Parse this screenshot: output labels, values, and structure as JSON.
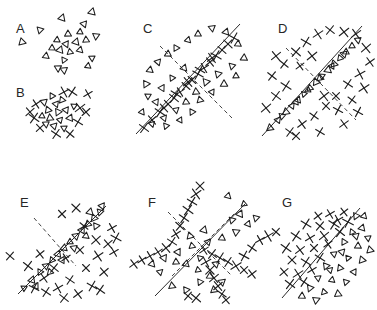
{
  "figure": {
    "width": 377,
    "height": 310,
    "background_color": "#ffffff",
    "ink_color": "#1f1f1f",
    "marker_types": {
      "triangle": "open-triangle-marker",
      "cross": "x-cross-marker"
    }
  },
  "panels": [
    {
      "id": "A",
      "label": "A",
      "label_x": 16,
      "label_y": 22,
      "origin_x": 0,
      "origin_y": 0,
      "description": "Loose isotropic cluster of open triangles only",
      "has_solid_line": false,
      "has_dashed_line": false,
      "triangles": [
        [
          62,
          18
        ],
        [
          92,
          12
        ],
        [
          40,
          30
        ],
        [
          68,
          34
        ],
        [
          80,
          32
        ],
        [
          57,
          40
        ],
        [
          66,
          44
        ],
        [
          76,
          42
        ],
        [
          86,
          40
        ],
        [
          22,
          42
        ],
        [
          60,
          50
        ],
        [
          70,
          52
        ],
        [
          80,
          50
        ],
        [
          52,
          48
        ],
        [
          64,
          60
        ],
        [
          96,
          36
        ],
        [
          92,
          58
        ],
        [
          58,
          68
        ],
        [
          64,
          70
        ],
        [
          88,
          66
        ],
        [
          46,
          56
        ],
        [
          84,
          24
        ]
      ],
      "crosses": []
    },
    {
      "id": "B",
      "label": "B",
      "label_x": 16,
      "label_y": 86,
      "origin_x": 0,
      "origin_y": 0,
      "description": "Mixed cluster of triangles and crosses, no structure",
      "has_solid_line": false,
      "has_dashed_line": false,
      "triangles": [
        [
          52,
          96
        ],
        [
          44,
          102
        ],
        [
          56,
          104
        ],
        [
          48,
          110
        ],
        [
          62,
          100
        ],
        [
          58,
          112
        ],
        [
          66,
          110
        ],
        [
          50,
          118
        ],
        [
          60,
          120
        ],
        [
          70,
          118
        ],
        [
          42,
          116
        ],
        [
          54,
          126
        ],
        [
          64,
          128
        ],
        [
          74,
          106
        ],
        [
          46,
          124
        ]
      ],
      "crosses": [
        [
          72,
          92
        ],
        [
          88,
          94
        ],
        [
          36,
          104
        ],
        [
          80,
          108
        ],
        [
          86,
          112
        ],
        [
          34,
          118
        ],
        [
          40,
          128
        ],
        [
          56,
          134
        ],
        [
          70,
          134
        ],
        [
          78,
          122
        ],
        [
          30,
          112
        ],
        [
          64,
          92
        ]
      ]
    },
    {
      "id": "C",
      "label": "C",
      "label_x": 143,
      "label_y": 22,
      "origin_x": 0,
      "origin_y": 0,
      "description": "Dense chain of crosses along a solid diagonal; triangles spread around; dashed perpendicular axis",
      "has_solid_line": true,
      "has_dashed_line": true,
      "solid_line": [
        136,
        134,
        240,
        24
      ],
      "dashed_line": [
        160,
        46,
        232,
        118
      ],
      "crosses": [
        [
          144,
          128
        ],
        [
          152,
          120
        ],
        [
          160,
          112
        ],
        [
          168,
          104
        ],
        [
          174,
          98
        ],
        [
          180,
          92
        ],
        [
          186,
          86
        ],
        [
          192,
          80
        ],
        [
          198,
          74
        ],
        [
          204,
          68
        ],
        [
          210,
          62
        ],
        [
          216,
          56
        ],
        [
          222,
          50
        ],
        [
          228,
          44
        ],
        [
          234,
          38
        ],
        [
          164,
          108
        ],
        [
          176,
          94
        ],
        [
          188,
          82
        ],
        [
          200,
          70
        ],
        [
          212,
          58
        ]
      ],
      "triangles": [
        [
          158,
          62
        ],
        [
          168,
          54
        ],
        [
          150,
          70
        ],
        [
          176,
          48
        ],
        [
          188,
          40
        ],
        [
          198,
          34
        ],
        [
          212,
          28
        ],
        [
          226,
          32
        ],
        [
          238,
          44
        ],
        [
          244,
          58
        ],
        [
          232,
          66
        ],
        [
          218,
          74
        ],
        [
          206,
          82
        ],
        [
          196,
          92
        ],
        [
          186,
          102
        ],
        [
          176,
          110
        ],
        [
          164,
          118
        ],
        [
          152,
          124
        ],
        [
          142,
          112
        ],
        [
          148,
          96
        ],
        [
          162,
          88
        ],
        [
          172,
          78
        ],
        [
          184,
          68
        ],
        [
          200,
          100
        ],
        [
          212,
          92
        ],
        [
          224,
          84
        ],
        [
          236,
          76
        ],
        [
          146,
          84
        ],
        [
          156,
          102
        ],
        [
          166,
          126
        ],
        [
          180,
          120
        ],
        [
          192,
          112
        ]
      ]
    },
    {
      "id": "D",
      "label": "D",
      "label_x": 278,
      "label_y": 22,
      "origin_x": 0,
      "origin_y": 0,
      "description": "Dense chain of triangles along a solid diagonal; crosses spread around; dashed perpendicular axis",
      "has_solid_line": true,
      "has_dashed_line": true,
      "solid_line": [
        262,
        136,
        362,
        26
      ],
      "dashed_line": [
        286,
        48,
        356,
        120
      ],
      "triangles": [
        [
          270,
          128
        ],
        [
          278,
          120
        ],
        [
          286,
          112
        ],
        [
          292,
          106
        ],
        [
          298,
          100
        ],
        [
          304,
          94
        ],
        [
          310,
          88
        ],
        [
          316,
          82
        ],
        [
          322,
          76
        ],
        [
          328,
          70
        ],
        [
          334,
          64
        ],
        [
          340,
          58
        ],
        [
          346,
          52
        ],
        [
          352,
          46
        ],
        [
          358,
          40
        ],
        [
          282,
          116
        ],
        [
          296,
          102
        ],
        [
          308,
          90
        ],
        [
          320,
          78
        ],
        [
          332,
          66
        ],
        [
          344,
          54
        ]
      ],
      "crosses": [
        [
          284,
          64
        ],
        [
          296,
          52
        ],
        [
          272,
          76
        ],
        [
          306,
          42
        ],
        [
          318,
          34
        ],
        [
          330,
          30
        ],
        [
          344,
          32
        ],
        [
          356,
          34
        ],
        [
          366,
          48
        ],
        [
          370,
          62
        ],
        [
          360,
          74
        ],
        [
          348,
          84
        ],
        [
          336,
          96
        ],
        [
          326,
          106
        ],
        [
          314,
          116
        ],
        [
          302,
          124
        ],
        [
          290,
          132
        ],
        [
          276,
          96
        ],
        [
          266,
          108
        ],
        [
          300,
          66
        ],
        [
          312,
          56
        ],
        [
          324,
          96
        ],
        [
          338,
          110
        ],
        [
          352,
          100
        ],
        [
          364,
          88
        ],
        [
          286,
          86
        ],
        [
          276,
          56
        ],
        [
          296,
          136
        ],
        [
          320,
          132
        ],
        [
          344,
          124
        ],
        [
          358,
          112
        ]
      ]
    },
    {
      "id": "E",
      "label": "E",
      "label_x": 20,
      "label_y": 196,
      "origin_x": 0,
      "origin_y": 0,
      "description": "Triangles along a solid diagonal; crosses concentrated to the lower-right half; short dashed axis",
      "has_solid_line": true,
      "has_dashed_line": true,
      "solid_line": [
        18,
        294,
        106,
        206
      ],
      "dashed_line": [
        34,
        218,
        76,
        266
      ],
      "triangles": [
        [
          24,
          288
        ],
        [
          32,
          280
        ],
        [
          40,
          272
        ],
        [
          46,
          266
        ],
        [
          52,
          260
        ],
        [
          58,
          254
        ],
        [
          64,
          248
        ],
        [
          70,
          242
        ],
        [
          76,
          236
        ],
        [
          82,
          230
        ],
        [
          88,
          224
        ],
        [
          94,
          218
        ],
        [
          100,
          212
        ],
        [
          36,
          286
        ],
        [
          50,
          272
        ],
        [
          62,
          260
        ],
        [
          74,
          248
        ],
        [
          86,
          236
        ],
        [
          96,
          226
        ],
        [
          90,
          212
        ],
        [
          102,
          206
        ]
      ],
      "crosses": [
        [
          62,
          214
        ],
        [
          76,
          208
        ],
        [
          10,
          256
        ],
        [
          84,
          226
        ],
        [
          96,
          240
        ],
        [
          80,
          250
        ],
        [
          66,
          258
        ],
        [
          54,
          268
        ],
        [
          44,
          278
        ],
        [
          34,
          288
        ],
        [
          46,
          292
        ],
        [
          58,
          288
        ],
        [
          70,
          280
        ],
        [
          86,
          268
        ],
        [
          98,
          256
        ],
        [
          108,
          244
        ],
        [
          112,
          228
        ],
        [
          104,
          272
        ],
        [
          92,
          286
        ],
        [
          78,
          294
        ],
        [
          64,
          298
        ],
        [
          40,
          254
        ],
        [
          28,
          266
        ],
        [
          114,
          252
        ],
        [
          100,
          290
        ],
        [
          116,
          238
        ]
      ]
    },
    {
      "id": "F",
      "label": "F",
      "label_x": 148,
      "label_y": 196,
      "origin_x": 0,
      "origin_y": 0,
      "description": "Crosses arranged along two crossing dashed diagonals forming an X; triangles fill the remaining quadrants; one solid separating line",
      "has_solid_line": true,
      "has_dashed_line": true,
      "solid_line": [
        155,
        296,
        245,
        204
      ],
      "dashed_line": [
        168,
        212,
        232,
        276
      ],
      "dashed_line_2": [
        172,
        276,
        236,
        212
      ],
      "crosses": [
        [
          200,
          186
        ],
        [
          196,
          194
        ],
        [
          192,
          202
        ],
        [
          188,
          210
        ],
        [
          184,
          218
        ],
        [
          180,
          226
        ],
        [
          176,
          234
        ],
        [
          172,
          242
        ],
        [
          166,
          248
        ],
        [
          158,
          252
        ],
        [
          150,
          256
        ],
        [
          142,
          260
        ],
        [
          134,
          264
        ],
        [
          204,
          250
        ],
        [
          212,
          254
        ],
        [
          220,
          258
        ],
        [
          228,
          262
        ],
        [
          236,
          266
        ],
        [
          244,
          270
        ],
        [
          252,
          274
        ],
        [
          206,
          262
        ],
        [
          210,
          270
        ],
        [
          214,
          278
        ],
        [
          218,
          286
        ],
        [
          222,
          294
        ],
        [
          226,
          300
        ],
        [
          260,
          240
        ],
        [
          268,
          236
        ],
        [
          276,
          232
        ],
        [
          252,
          248
        ],
        [
          244,
          256
        ],
        [
          196,
          298
        ],
        [
          188,
          296
        ]
      ],
      "triangles": [
        [
          228,
          196
        ],
        [
          240,
          214
        ],
        [
          248,
          224
        ],
        [
          236,
          232
        ],
        [
          222,
          238
        ],
        [
          208,
          242
        ],
        [
          192,
          246
        ],
        [
          178,
          252
        ],
        [
          164,
          258
        ],
        [
          152,
          264
        ],
        [
          186,
          264
        ],
        [
          198,
          270
        ],
        [
          210,
          276
        ],
        [
          222,
          282
        ],
        [
          172,
          286
        ],
        [
          186,
          290
        ],
        [
          200,
          282
        ],
        [
          214,
          290
        ],
        [
          160,
          272
        ],
        [
          244,
          204
        ],
        [
          256,
          218
        ],
        [
          232,
          220
        ],
        [
          204,
          230
        ],
        [
          190,
          236
        ],
        [
          176,
          262
        ],
        [
          200,
          258
        ],
        [
          216,
          264
        ]
      ]
    },
    {
      "id": "G",
      "label": "G",
      "label_x": 282,
      "label_y": 196,
      "origin_x": 0,
      "origin_y": 0,
      "description": "Linearly separable classes: crosses upper-left of a solid boundary line, triangles lower-right",
      "has_solid_line": true,
      "has_dashed_line": false,
      "solid_line": [
        282,
        298,
        360,
        208
      ],
      "crosses": [
        [
          318,
          216
        ],
        [
          330,
          214
        ],
        [
          344,
          212
        ],
        [
          306,
          224
        ],
        [
          320,
          226
        ],
        [
          334,
          224
        ],
        [
          296,
          236
        ],
        [
          310,
          238
        ],
        [
          324,
          236
        ],
        [
          340,
          232
        ],
        [
          286,
          248
        ],
        [
          300,
          250
        ],
        [
          314,
          248
        ],
        [
          328,
          244
        ],
        [
          292,
          260
        ],
        [
          306,
          262
        ],
        [
          320,
          258
        ],
        [
          284,
          272
        ],
        [
          298,
          274
        ],
        [
          312,
          270
        ],
        [
          290,
          284
        ],
        [
          304,
          282
        ],
        [
          338,
          220
        ],
        [
          348,
          222
        ]
      ],
      "triangles": [
        [
          356,
          216
        ],
        [
          362,
          228
        ],
        [
          352,
          232
        ],
        [
          368,
          238
        ],
        [
          344,
          242
        ],
        [
          358,
          246
        ],
        [
          370,
          250
        ],
        [
          334,
          254
        ],
        [
          348,
          258
        ],
        [
          362,
          260
        ],
        [
          326,
          266
        ],
        [
          340,
          268
        ],
        [
          354,
          272
        ],
        [
          318,
          278
        ],
        [
          332,
          280
        ],
        [
          346,
          282
        ],
        [
          310,
          288
        ],
        [
          324,
          292
        ],
        [
          338,
          294
        ],
        [
          302,
          296
        ],
        [
          316,
          300
        ],
        [
          364,
          216
        ],
        [
          356,
          236
        ],
        [
          342,
          252
        ],
        [
          330,
          270
        ]
      ]
    }
  ]
}
